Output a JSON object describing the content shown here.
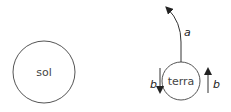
{
  "diagram": {
    "bodies": [
      {
        "id": "sun",
        "label": "sol"
      },
      {
        "id": "earth",
        "label": "terra"
      }
    ],
    "arrows": [
      {
        "id": "a",
        "label": "a",
        "description": "curved arrow rising from top of terra"
      },
      {
        "id": "b_left",
        "label": "b",
        "direction": "down"
      },
      {
        "id": "b_right",
        "label": "b",
        "direction": "up"
      }
    ],
    "colors": {
      "stroke": "#333333",
      "text": "#444444"
    }
  }
}
